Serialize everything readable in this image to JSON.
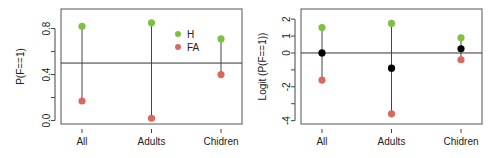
{
  "chart_data": [
    {
      "type": "scatter",
      "title": "",
      "xlabel": "",
      "ylabel": "P(F==1)",
      "categories": [
        "All",
        "Adults",
        "Chidren"
      ],
      "ylim": [
        -0.03,
        0.97
      ],
      "yticks": [
        0.0,
        0.4,
        0.8
      ],
      "ytick_labels": [
        "0.0",
        "0.4",
        "0.8"
      ],
      "extra_ticks": [
        0.2,
        0.6
      ],
      "hline": 0.5,
      "series": [
        {
          "name": "H",
          "color": "#7dc142",
          "values": [
            0.82,
            0.85,
            0.71
          ]
        },
        {
          "name": "FA",
          "color": "#d9695f",
          "values": [
            0.17,
            0.02,
            0.4
          ]
        }
      ],
      "segments": "H-to-FA per category",
      "legend": {
        "position": "top-right",
        "entries": [
          "H",
          "FA"
        ]
      },
      "grid": false
    },
    {
      "type": "scatter",
      "title": "",
      "xlabel": "",
      "ylabel": "Logit (P(F==1))",
      "categories": [
        "All",
        "Adults",
        "Chidren"
      ],
      "ylim": [
        -4.2,
        2.6
      ],
      "yticks": [
        2,
        0,
        -2,
        -4
      ],
      "ytick_labels": [
        "2",
        "0",
        "-2",
        "-4"
      ],
      "extra_ticks": [
        1,
        -1,
        -3
      ],
      "extra_tick_labels": [
        "1",
        "",
        ""
      ],
      "hline": 0,
      "series": [
        {
          "name": "H",
          "color": "#7dc142",
          "values": [
            1.5,
            1.75,
            0.9
          ]
        },
        {
          "name": "FA",
          "color": "#d9695f",
          "values": [
            -1.6,
            -3.6,
            -0.4
          ]
        },
        {
          "name": "Mean",
          "color": "#000000",
          "values": [
            0.0,
            -0.9,
            0.25
          ]
        }
      ],
      "segments": "H-to-FA per category",
      "legend": null,
      "grid": false
    }
  ]
}
